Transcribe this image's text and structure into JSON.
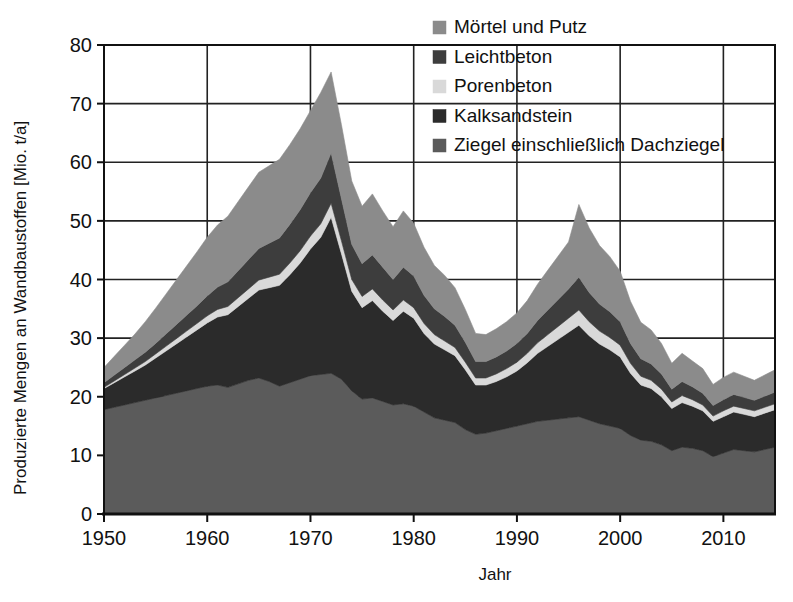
{
  "chart_data": {
    "type": "area",
    "stacked": true,
    "title": "",
    "xlabel": "Jahr",
    "ylabel": "Produzierte Mengen an Wandbaustoffen [Mio. t/a]",
    "xlim": [
      1950,
      2015
    ],
    "ylim": [
      0,
      80
    ],
    "xticks": [
      1950,
      1960,
      1970,
      1980,
      1990,
      2000,
      2010
    ],
    "xtick_labels": [
      "1950",
      "1960",
      "1970",
      "1980",
      "1990",
      "2000",
      "2010"
    ],
    "yticks": [
      0,
      10,
      20,
      30,
      40,
      50,
      60,
      70,
      80
    ],
    "ytick_labels": [
      "0",
      "10",
      "20",
      "30",
      "40",
      "50",
      "60",
      "70",
      "80"
    ],
    "grid": true,
    "legend_position": "top-right",
    "legend_order_top_to_bottom": [
      "Mörtel und Putz",
      "Leichtbeton",
      "Porenbeton",
      "Kalksandstein",
      "Ziegel einschließlich Dachziegel"
    ],
    "x": [
      1950,
      1951,
      1952,
      1953,
      1954,
      1955,
      1956,
      1957,
      1958,
      1959,
      1960,
      1961,
      1962,
      1963,
      1964,
      1965,
      1966,
      1967,
      1968,
      1969,
      1970,
      1971,
      1972,
      1973,
      1974,
      1975,
      1976,
      1977,
      1978,
      1979,
      1980,
      1981,
      1982,
      1983,
      1984,
      1985,
      1986,
      1987,
      1988,
      1989,
      1990,
      1991,
      1992,
      1993,
      1994,
      1995,
      1996,
      1997,
      1998,
      1999,
      2000,
      2001,
      2002,
      2003,
      2004,
      2005,
      2006,
      2007,
      2008,
      2009,
      2010,
      2011,
      2012,
      2013,
      2014,
      2015
    ],
    "series": [
      {
        "name": "Ziegel einschließlich Dachziegel",
        "color": "#5b5b5b",
        "values": [
          17.8,
          18.2,
          18.6,
          19.0,
          19.4,
          19.8,
          20.2,
          20.6,
          21.0,
          21.4,
          21.8,
          22.0,
          21.6,
          22.2,
          22.8,
          23.2,
          22.6,
          21.8,
          22.4,
          23.0,
          23.6,
          23.8,
          24.0,
          23.0,
          21.0,
          19.6,
          19.8,
          19.2,
          18.6,
          18.8,
          18.4,
          17.4,
          16.4,
          16.0,
          15.6,
          14.4,
          13.6,
          13.8,
          14.2,
          14.6,
          15.0,
          15.4,
          15.8,
          16.0,
          16.2,
          16.4,
          16.6,
          16.0,
          15.4,
          15.0,
          14.6,
          13.4,
          12.6,
          12.4,
          11.8,
          10.8,
          11.4,
          11.2,
          10.8,
          9.8,
          10.4,
          11.0,
          10.8,
          10.6,
          11.0,
          11.4
        ]
      },
      {
        "name": "Kalksandstein",
        "color": "#2b2b2b",
        "values": [
          3.6,
          4.2,
          4.8,
          5.4,
          6.0,
          6.8,
          7.6,
          8.4,
          9.2,
          10.0,
          10.8,
          11.6,
          12.4,
          13.2,
          14.0,
          15.0,
          16.0,
          17.2,
          18.4,
          19.8,
          21.6,
          23.4,
          26.6,
          21.4,
          17.0,
          15.6,
          16.6,
          15.4,
          14.4,
          15.8,
          15.0,
          13.4,
          12.6,
          12.0,
          11.4,
          10.2,
          8.4,
          8.2,
          8.4,
          8.8,
          9.4,
          10.4,
          11.6,
          12.6,
          13.6,
          14.6,
          15.6,
          14.4,
          13.6,
          13.0,
          12.2,
          10.6,
          9.4,
          9.0,
          8.2,
          7.2,
          7.6,
          7.2,
          6.8,
          6.0,
          6.2,
          6.4,
          6.2,
          6.0,
          6.2,
          6.4
        ]
      },
      {
        "name": "Porenbeton",
        "color": "#d9d9d9",
        "values": [
          0.2,
          0.3,
          0.4,
          0.5,
          0.6,
          0.7,
          0.8,
          0.9,
          1.0,
          1.1,
          1.2,
          1.3,
          1.4,
          1.5,
          1.6,
          1.7,
          1.8,
          1.9,
          2.0,
          2.1,
          2.2,
          2.3,
          2.4,
          2.2,
          2.0,
          1.9,
          2.0,
          1.9,
          1.8,
          1.9,
          1.8,
          1.7,
          1.6,
          1.5,
          1.4,
          1.3,
          1.2,
          1.2,
          1.3,
          1.4,
          1.5,
          1.6,
          1.8,
          2.0,
          2.2,
          2.4,
          2.6,
          2.4,
          2.2,
          2.1,
          2.0,
          1.7,
          1.5,
          1.4,
          1.3,
          1.1,
          1.2,
          1.1,
          1.0,
          0.9,
          1.0,
          1.0,
          1.0,
          1.0,
          1.0,
          1.0
        ]
      },
      {
        "name": "Leichtbeton",
        "color": "#3d3d3d",
        "values": [
          0.8,
          1.0,
          1.2,
          1.4,
          1.6,
          1.8,
          2.1,
          2.4,
          2.7,
          3.0,
          3.4,
          3.8,
          4.2,
          4.6,
          5.0,
          5.4,
          5.8,
          6.2,
          6.6,
          7.0,
          7.4,
          7.8,
          8.6,
          7.2,
          6.0,
          5.6,
          5.8,
          5.6,
          5.2,
          5.6,
          5.4,
          4.8,
          4.4,
          4.2,
          3.8,
          3.4,
          2.8,
          2.8,
          2.9,
          3.0,
          3.2,
          3.4,
          3.8,
          4.2,
          4.6,
          5.0,
          5.6,
          5.0,
          4.6,
          4.4,
          4.0,
          3.4,
          3.0,
          2.8,
          2.6,
          2.2,
          2.4,
          2.2,
          2.0,
          1.8,
          1.9,
          2.0,
          1.9,
          1.8,
          1.9,
          2.0
        ]
      },
      {
        "name": "Mörtel und Putz",
        "color": "#8b8b8b",
        "values": [
          2.6,
          3.2,
          3.8,
          4.4,
          5.2,
          6.0,
          6.8,
          7.6,
          8.4,
          9.2,
          10.0,
          10.6,
          11.2,
          11.8,
          12.4,
          13.0,
          13.2,
          13.4,
          13.6,
          13.8,
          14.0,
          14.6,
          13.8,
          12.6,
          10.8,
          9.8,
          10.4,
          9.6,
          9.0,
          9.6,
          9.0,
          8.2,
          7.4,
          7.0,
          6.4,
          5.6,
          4.8,
          4.6,
          4.8,
          5.0,
          5.2,
          5.6,
          6.2,
          6.8,
          7.4,
          8.0,
          12.4,
          11.0,
          10.0,
          9.4,
          8.6,
          7.2,
          6.2,
          5.8,
          5.2,
          4.4,
          4.8,
          4.4,
          4.2,
          3.6,
          3.8,
          3.8,
          3.6,
          3.4,
          3.6,
          3.8
        ]
      }
    ],
    "annotations": {
      "peak_year": "1972",
      "peak_total": "75.5",
      "trough_year": "1986",
      "trough_total": "21.0",
      "secondary_peak_year": "1996",
      "secondary_peak_total": "53.0"
    }
  },
  "legend": {
    "items": [
      {
        "label": "Mörtel und Putz",
        "color": "#8b8b8b"
      },
      {
        "label": "Leichtbeton",
        "color": "#3d3d3d"
      },
      {
        "label": "Porenbeton",
        "color": "#d9d9d9"
      },
      {
        "label": "Kalksandstein",
        "color": "#2b2b2b"
      },
      {
        "label": "Ziegel einschließlich Dachziegel",
        "color": "#5b5b5b"
      }
    ]
  },
  "axes": {
    "y_title": "Produzierte Mengen an Wandbaustoffen [Mio. t/a]",
    "x_title": "Jahr",
    "y_ticks": [
      "80",
      "70",
      "60",
      "50",
      "40",
      "30",
      "20",
      "10",
      "0"
    ],
    "x_ticks": [
      "1950",
      "1960",
      "1970",
      "1980",
      "1990",
      "2000",
      "2010"
    ]
  },
  "style": {
    "background": "#ffffff",
    "axis_color": "#111111",
    "grid_color": "#222222"
  }
}
